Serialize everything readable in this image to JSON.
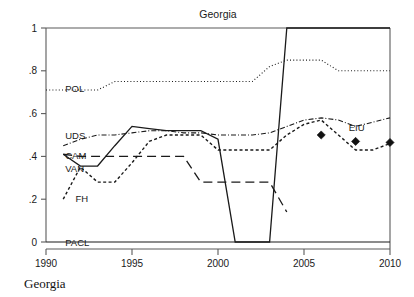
{
  "chart_data": {
    "type": "line",
    "title": "Georgia",
    "caption": "Georgia",
    "xlabel": "",
    "ylabel": "",
    "xlim": [
      1990,
      2010
    ],
    "ylim": [
      0,
      1
    ],
    "grid": false,
    "legend_position": "inline-left-labels",
    "xticks": [
      "1990",
      "1995",
      "2000",
      "2005",
      "2010"
    ],
    "xtick_values": [
      1990,
      1995,
      2000,
      2005,
      2010
    ],
    "yticks": [
      "0",
      ".2",
      ".4",
      ".6",
      ".8",
      "1"
    ],
    "ytick_values": [
      0,
      0.2,
      0.4,
      0.6,
      0.8,
      1
    ],
    "series": [
      {
        "name": "POL",
        "style": "dotted",
        "label_x": 1991.0,
        "label_y": 0.715,
        "x": [
          1990,
          1991,
          1992,
          1993,
          1994,
          1995,
          1996,
          1997,
          1998,
          1999,
          2000,
          2001,
          2002,
          2003,
          2004,
          2005,
          2006,
          2007,
          2008,
          2009,
          2010
        ],
        "values": [
          0.71,
          0.71,
          0.71,
          0.71,
          0.75,
          0.75,
          0.75,
          0.75,
          0.75,
          0.75,
          0.75,
          0.75,
          0.75,
          0.82,
          0.85,
          0.85,
          0.85,
          0.8,
          0.8,
          0.8,
          0.8
        ]
      },
      {
        "name": "UDS",
        "style": "dashdot",
        "label_x": 1991.0,
        "label_y": 0.497,
        "x": [
          1991,
          1992,
          1993,
          1994,
          1995,
          1996,
          1997,
          1998,
          1999,
          2000,
          2001,
          2002,
          2003,
          2004,
          2005,
          2006,
          2007,
          2008,
          2009,
          2010
        ],
        "values": [
          0.45,
          0.48,
          0.5,
          0.5,
          0.51,
          0.52,
          0.52,
          0.51,
          0.51,
          0.5,
          0.5,
          0.5,
          0.51,
          0.54,
          0.57,
          0.58,
          0.57,
          0.54,
          0.56,
          0.58
        ]
      },
      {
        "name": "CAM",
        "style": "longdash",
        "label_x": 1991.0,
        "label_y": 0.405,
        "x": [
          1991,
          1992,
          1993,
          1994,
          1995,
          1996,
          1997,
          1998,
          1999,
          2000,
          2001,
          2002,
          2003,
          2004
        ],
        "values": [
          0.41,
          0.4,
          0.4,
          0.4,
          0.4,
          0.4,
          0.4,
          0.4,
          0.28,
          0.28,
          0.28,
          0.28,
          0.28,
          0.14
        ]
      },
      {
        "name": "VAN",
        "style": "solid",
        "label_x": 1991.0,
        "label_y": 0.345,
        "x": [
          1991,
          1992,
          1993,
          1994,
          1995,
          1996,
          1997,
          1998,
          1999,
          2000,
          2001,
          2002,
          2003,
          2004,
          2005,
          2006,
          2007,
          2008,
          2009,
          2010
        ],
        "values": [
          0.41,
          0.355,
          0.355,
          0.45,
          0.54,
          0.53,
          0.52,
          0.52,
          0.52,
          0.48,
          0.0,
          0.0,
          0.0,
          1.0,
          1.0,
          1.0,
          1.0,
          1.0,
          1.0,
          1.0
        ]
      },
      {
        "name": "FH",
        "style": "shortdash",
        "label_x": 1991.6,
        "label_y": 0.205,
        "x": [
          1991,
          1992,
          1993,
          1994,
          1995,
          1996,
          1997,
          1998,
          1999,
          2000,
          2001,
          2002,
          2003,
          2004,
          2005,
          2006,
          2007,
          2008,
          2009,
          2010
        ],
        "values": [
          0.2,
          0.35,
          0.28,
          0.28,
          0.37,
          0.47,
          0.5,
          0.5,
          0.5,
          0.43,
          0.43,
          0.43,
          0.43,
          0.5,
          0.55,
          0.57,
          0.5,
          0.43,
          0.43,
          0.46
        ]
      },
      {
        "name": "PACL",
        "style": "solid-flat",
        "label_x": 1991.0,
        "label_y": 0.0,
        "x": [
          1990,
          2010
        ],
        "values": [
          0.0,
          0.0
        ]
      }
    ],
    "markers": {
      "name": "EIU",
      "style": "filled-diamond",
      "label_x": 2007.6,
      "label_y": 0.52,
      "x": [
        2006,
        2008,
        2010
      ],
      "values": [
        0.5,
        0.47,
        0.465
      ]
    }
  }
}
